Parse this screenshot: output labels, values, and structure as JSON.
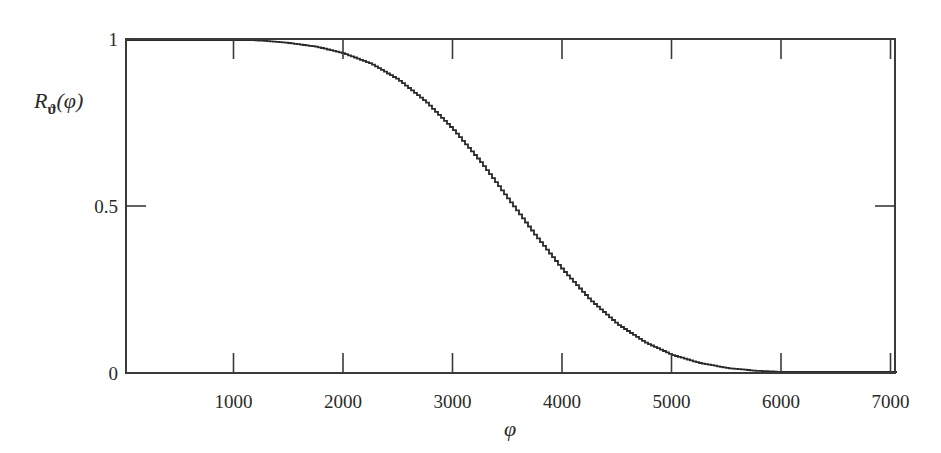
{
  "chart_data": {
    "type": "line",
    "title": "",
    "xlabel": "φ",
    "ylabel": "R_ϑ(φ)",
    "ylabel_main": "R",
    "ylabel_sub": "ϑ",
    "ylabel_arg": "(φ)",
    "xlim": [
      0,
      7100
    ],
    "ylim": [
      0,
      1
    ],
    "x_ticks": [
      1000,
      2000,
      3000,
      4000,
      5000,
      6000,
      7000
    ],
    "x_tick_labels": [
      "1000",
      "2000",
      "3000",
      "4000",
      "5000",
      "6000",
      "7000"
    ],
    "y_ticks": [
      0,
      0.5,
      1
    ],
    "y_tick_labels": [
      "0",
      "0.5",
      "1"
    ],
    "grid": false,
    "legend": null,
    "line_color": "#2a2a2a",
    "series": [
      {
        "name": "R_ϑ(φ)",
        "x": [
          0,
          1000,
          1300,
          1500,
          1750,
          2000,
          2250,
          2500,
          2750,
          3000,
          3250,
          3500,
          3750,
          4000,
          4250,
          4500,
          4750,
          5000,
          5250,
          5500,
          5750,
          6000,
          6500,
          7000,
          7100
        ],
        "values": [
          1.0,
          1.0,
          0.994,
          0.988,
          0.977,
          0.957,
          0.926,
          0.878,
          0.812,
          0.729,
          0.632,
          0.522,
          0.412,
          0.309,
          0.219,
          0.146,
          0.092,
          0.054,
          0.03,
          0.015,
          0.007,
          0.003,
          0.0005,
          0.0,
          0.0
        ]
      }
    ]
  }
}
